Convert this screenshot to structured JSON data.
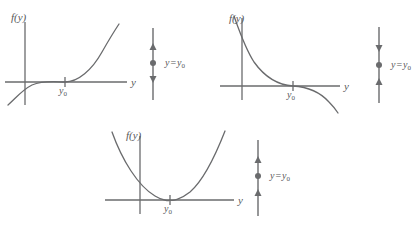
{
  "figure": {
    "type": "diagram",
    "stroke_color": "#6a6b6d",
    "text_color": "#57585a",
    "background": "#ffffff",
    "width": 420,
    "height": 236
  },
  "panels": [
    {
      "id": "panel-unstable-increasing",
      "vertical_axis_label": "f(y)",
      "horizontal_axis_label": "y",
      "equilibrium_tick_label": "y",
      "equilibrium_tick_sub": "0",
      "curve_kind": "increasing-through-zero",
      "curve_description": "cubic-like curve rising from lower-left, crossing the y-axis at y0 going upward",
      "phase_line": {
        "label_var": "y",
        "label_eq": "=",
        "label_value": "y",
        "label_value_sub": "0",
        "markers": [
          "arrow-up",
          "dot",
          "arrow-down"
        ],
        "marker_description": "arrows point away from the equilibrium dot (unstable)"
      }
    },
    {
      "id": "panel-stable-decreasing",
      "vertical_axis_label": "f(y)",
      "horizontal_axis_label": "y",
      "equilibrium_tick_label": "y",
      "equilibrium_tick_sub": "0",
      "curve_kind": "decreasing-through-zero",
      "curve_description": "curve falling from upper-left, crossing the y-axis at y0 going downward",
      "phase_line": {
        "label_var": "y",
        "label_eq": "=",
        "label_value": "y",
        "label_value_sub": "0",
        "markers": [
          "arrow-down",
          "dot",
          "arrow-up"
        ],
        "marker_description": "arrows point toward the equilibrium dot (asymptotically stable)"
      }
    },
    {
      "id": "panel-semistable-parabola",
      "vertical_axis_label": "f(y)",
      "horizontal_axis_label": "y",
      "equilibrium_tick_label": "y",
      "equilibrium_tick_sub": "0",
      "curve_kind": "parabola-tangent",
      "curve_description": "upward parabola tangent to the y-axis at y0",
      "phase_line": {
        "label_var": "y",
        "label_eq": "=",
        "label_value": "y",
        "label_value_sub": "0",
        "markers": [
          "arrow-up",
          "dot",
          "arrow-up"
        ],
        "marker_description": "arrows both point upward through the equilibrium dot (semistable)"
      }
    }
  ]
}
